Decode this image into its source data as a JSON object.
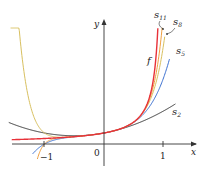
{
  "chart_data": {
    "type": "line",
    "title": "",
    "xlabel": "x",
    "ylabel": "y",
    "x_ticks": [
      {
        "value": -1,
        "label": "−1"
      },
      {
        "value": 0,
        "label": "0"
      },
      {
        "value": 1,
        "label": "1"
      }
    ],
    "xlim": [
      -1.6,
      1.25
    ],
    "ylim": [
      -1.5,
      11.5
    ],
    "grid": false,
    "function": "f(x) = 1/(1 − x)",
    "series": [
      {
        "name": "f",
        "label": "f",
        "color": "#e8323a",
        "description": "1/(1-x)"
      },
      {
        "name": "s11",
        "label": "s11",
        "color": "#f0a040",
        "description": "sum_{n=0}^{11} x^n"
      },
      {
        "name": "s8",
        "label": "s8",
        "color": "#d8c060",
        "description": "sum_{n=0}^{8} x^n"
      },
      {
        "name": "s5",
        "label": "s5",
        "color": "#3a6fd0",
        "description": "sum_{n=0}^{5} x^n"
      },
      {
        "name": "s2",
        "label": "s2",
        "color": "#333333",
        "description": "1 + x + x^2"
      }
    ],
    "annotations": [
      "f",
      "s11",
      "s8",
      "s5",
      "s2"
    ]
  },
  "labels": {
    "x_axis": "x",
    "y_axis": "y",
    "f": "f",
    "s11_base": "s",
    "s11_sub": "11",
    "s8_base": "s",
    "s8_sub": "8",
    "s5_base": "s",
    "s5_sub": "5",
    "s2_base": "s",
    "s2_sub": "2",
    "tick_neg1": "−1",
    "tick_0": "0",
    "tick_1": "1"
  }
}
